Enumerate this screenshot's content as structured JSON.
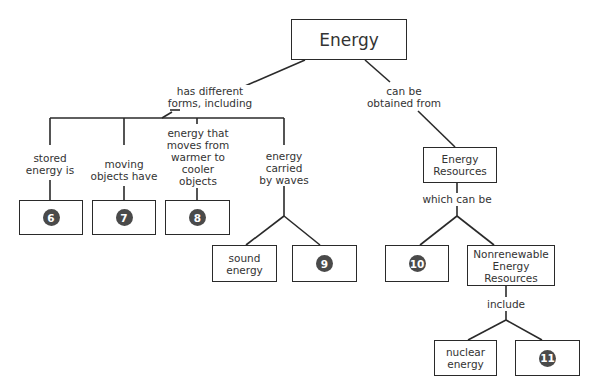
{
  "root": {
    "label": "Energy"
  },
  "links": {
    "forms": "has different\nforms, including",
    "obtained": "can be\nobtained from",
    "stored": "stored\nenergy is",
    "moving": "moving\nobjects have",
    "heat": "energy that\nmoves from\nwarmer to\ncooler\nobjects",
    "waves": "energy\ncarried\nby waves",
    "which": "which can be",
    "include": "include"
  },
  "nodes": {
    "n6": "6",
    "n7": "7",
    "n8": "8",
    "sound": "sound\nenergy",
    "n9": "9",
    "resources": "Energy\nResources",
    "n10": "10",
    "nonrenewable": "Nonrenewable\nEnergy\nResources",
    "nuclear": "nuclear\nenergy",
    "n11": "11"
  }
}
